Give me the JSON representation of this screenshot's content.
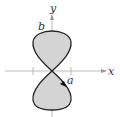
{
  "diagram": {
    "type": "parametric-curve-figure-eight",
    "axes": {
      "x_label": "x",
      "y_label": "y"
    },
    "labels": {
      "top": "b",
      "right": "a"
    },
    "colors": {
      "fill": "#d4d4d4",
      "curve": "#222222",
      "axis": "#999999"
    },
    "orientation_arrow": "clockwise-down-right"
  }
}
